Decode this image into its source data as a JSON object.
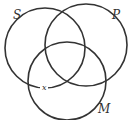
{
  "diagram": {
    "type": "venn",
    "circles": [
      {
        "label": "S",
        "cx": 45,
        "cy": 48,
        "r": 40,
        "label_x": 14,
        "label_y": 18
      },
      {
        "label": "P",
        "cx": 86,
        "cy": 45,
        "r": 41,
        "label_x": 113,
        "label_y": 18
      },
      {
        "label": "M",
        "cx": 67,
        "cy": 82,
        "r": 40,
        "label_x": 99,
        "label_y": 112
      }
    ],
    "marks": [
      {
        "text": "x",
        "x": 45,
        "y": 89
      }
    ],
    "stroke_color": "#333333"
  }
}
